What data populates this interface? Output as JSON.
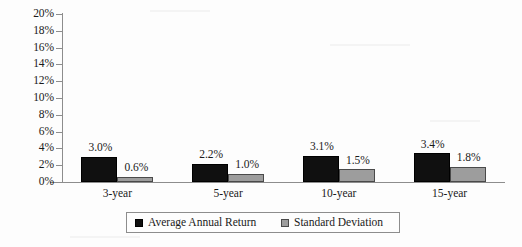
{
  "chart_data": {
    "type": "bar",
    "title": "",
    "subtitle": "",
    "xlabel": "",
    "ylabel": "",
    "categories": [
      "3-year",
      "5-year",
      "10-year",
      "15-year"
    ],
    "series": [
      {
        "name": "Average Annual Return",
        "color": "#101010",
        "values": [
          3.0,
          2.2,
          3.1,
          3.4
        ],
        "labels": [
          "3.0%",
          "2.2%",
          "3.1%",
          "3.4%"
        ]
      },
      {
        "name": "Standard Deviation",
        "color": "#9d9d9d",
        "values": [
          0.6,
          1.0,
          1.5,
          1.8
        ],
        "labels": [
          "0.6%",
          "1.0%",
          "1.5%",
          "1.8%"
        ]
      }
    ],
    "ylim": [
      0,
      20
    ],
    "ytick_step": 2,
    "ytick_labels": [
      "0%",
      "2%",
      "4%",
      "6%",
      "8%",
      "10%",
      "12%",
      "14%",
      "16%",
      "18%",
      "20%"
    ],
    "grid": false,
    "legend_position": "bottom",
    "value_format": "percent"
  },
  "legend": {
    "entries": [
      {
        "label": "Average Annual Return"
      },
      {
        "label": "Standard Deviation"
      }
    ]
  }
}
